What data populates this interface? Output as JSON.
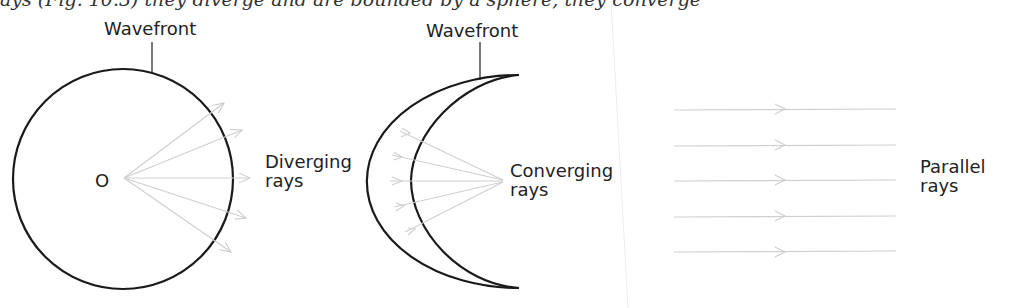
{
  "top_text_clipped": "ays (Fig. 10.3) they diverge and are bounded by a sphere, they converge",
  "panels": [
    {
      "name": "diverging",
      "wavefront_label": "Wavefront",
      "center_label": "O",
      "rays_label_line1": "Diverging",
      "rays_label_line2": "rays"
    },
    {
      "name": "converging",
      "wavefront_label": "Wavefront",
      "rays_label_line1": "Converging",
      "rays_label_line2": "rays"
    },
    {
      "name": "parallel",
      "rays_label_line1": "Parallel",
      "rays_label_line2": "rays"
    }
  ],
  "colors": {
    "wavefront": "#1a1a1a",
    "rays": "#cfcfcf"
  }
}
